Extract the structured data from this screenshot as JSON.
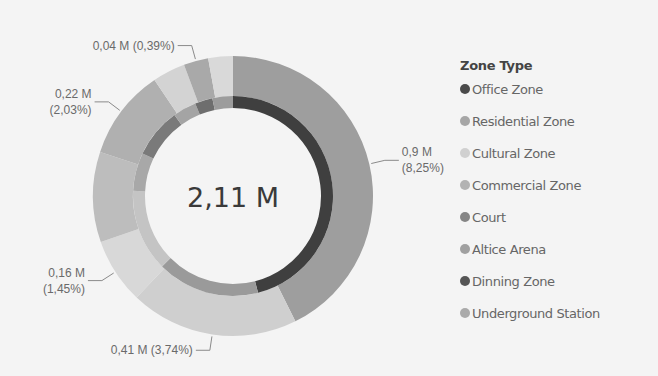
{
  "chart_data": {
    "type": "pie",
    "subtype": "donut",
    "center_label": "2,11 M",
    "legend": {
      "title": "Zone Type",
      "position": "right",
      "items": [
        {
          "label": "Office Zone",
          "color": "#4a4a4a"
        },
        {
          "label": "Residential Zone",
          "color": "#a6a6a6"
        },
        {
          "label": "Cultural Zone",
          "color": "#d0d0d0"
        },
        {
          "label": "Commercial Zone",
          "color": "#b3b3b3"
        },
        {
          "label": "Court",
          "color": "#858585"
        },
        {
          "label": "Altice Arena",
          "color": "#a0a0a0"
        },
        {
          "label": "Dinning Zone",
          "color": "#555555"
        },
        {
          "label": "Underground Station",
          "color": "#aaaaaa"
        }
      ]
    },
    "outer_ring": [
      {
        "value": 0.9,
        "label": "0,9 M\n(8,25%)",
        "color": "#9e9e9e"
      },
      {
        "value": 0.41,
        "label": "0,41 M (3,74%)",
        "color": "#cfcfcf"
      },
      {
        "value": 0.16,
        "label": "0,16 M\n(1,45%)",
        "color": "#d8d8d8"
      },
      {
        "value": 0.22,
        "label": "",
        "color": "#bdbdbd"
      },
      {
        "value": 0.22,
        "label": "0,22 M\n(2,03%)",
        "color": "#b0b0b0"
      },
      {
        "value": 0.08,
        "label": "",
        "color": "#d3d3d3"
      },
      {
        "value": 0.06,
        "label": "0,04 M (0,39%)",
        "color": "#a9a9a9"
      },
      {
        "value": 0.06,
        "label": "",
        "color": "#d9d9d9"
      }
    ],
    "inner_ring": [
      {
        "value": 0.97,
        "color": "#3f3f3f"
      },
      {
        "value": 0.35,
        "color": "#9a9a9a"
      },
      {
        "value": 0.28,
        "color": "#c4c4c4"
      },
      {
        "value": 0.13,
        "color": "#a8a8a8"
      },
      {
        "value": 0.17,
        "color": "#7a7a7a"
      },
      {
        "value": 0.08,
        "color": "#a4a4a4"
      },
      {
        "value": 0.06,
        "color": "#6e6e6e"
      },
      {
        "value": 0.07,
        "color": "#9c9c9c"
      }
    ]
  }
}
